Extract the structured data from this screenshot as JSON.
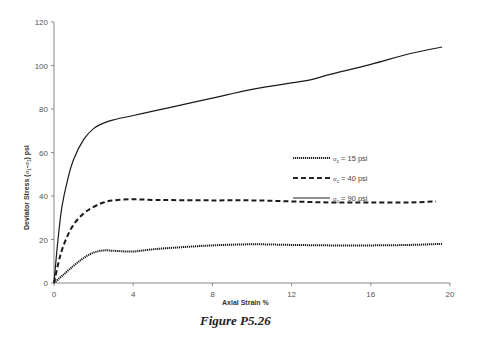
{
  "chart_data": {
    "type": "line",
    "title": "",
    "caption": "Figure P5.26",
    "xlabel": "Axial Strain %",
    "ylabel": "Deviator Stress (σ1-σ3) psi",
    "xlim": [
      0,
      20
    ],
    "ylim": [
      0,
      120
    ],
    "x_ticks": [
      0,
      4,
      8,
      12,
      16,
      20
    ],
    "y_ticks": [
      0,
      20,
      40,
      60,
      80,
      100,
      120
    ],
    "grid": false,
    "legend_position": "right-middle",
    "series": [
      {
        "name": "σc = 15 psi",
        "style": "dotted",
        "x": [
          0,
          0.5,
          1,
          1.5,
          2,
          2.5,
          3,
          4,
          5,
          6,
          8,
          10,
          12,
          14,
          16,
          18,
          19.6
        ],
        "y": [
          0,
          4,
          8,
          11.5,
          14,
          15,
          14.8,
          14.5,
          15.5,
          16.2,
          17.3,
          17.8,
          17.5,
          17.3,
          17.3,
          17.5,
          18
        ]
      },
      {
        "name": "σc = 40 psi",
        "style": "dashed",
        "x": [
          0,
          0.3,
          0.6,
          1,
          1.5,
          2,
          2.5,
          3,
          4,
          5,
          6,
          8,
          10,
          12,
          14,
          16,
          18,
          19.3
        ],
        "y": [
          0,
          12,
          20,
          27,
          32,
          35,
          37,
          38,
          38.5,
          38.2,
          38.1,
          38,
          38,
          37.5,
          37,
          37,
          37,
          37.5
        ]
      },
      {
        "name": "σc = 90 psi",
        "style": "solid",
        "x": [
          0,
          0.2,
          0.4,
          0.7,
          1,
          1.5,
          2,
          2.5,
          3,
          4,
          5,
          6,
          8,
          10,
          12,
          13,
          14,
          16,
          18,
          19.6
        ],
        "y": [
          0,
          20,
          35,
          48,
          57,
          66,
          71,
          73.5,
          75,
          77,
          79,
          81,
          85,
          89,
          92,
          93.5,
          96,
          100.5,
          105.5,
          108.5
        ]
      }
    ]
  },
  "axes": {
    "x_title": "Axial Strain %",
    "y_title_prefix": "Deviator Stress (",
    "y_title_sigma1": "σ",
    "y_title_sub1": "1",
    "y_title_minus": "-",
    "y_title_sigma3": "σ",
    "y_title_sub3": "3",
    "y_title_suffix": ") psi"
  },
  "legend": [
    {
      "sigma": "σ",
      "sub": "c",
      "text": " = 15 psi",
      "style": "dotted"
    },
    {
      "sigma": "σ",
      "sub": "c",
      "text": " = 40 psi",
      "style": "dashed"
    },
    {
      "sigma": "σ",
      "sub": "c",
      "text": " = 90 psi",
      "style": "solid"
    }
  ],
  "figure_caption": "Figure P5.26"
}
